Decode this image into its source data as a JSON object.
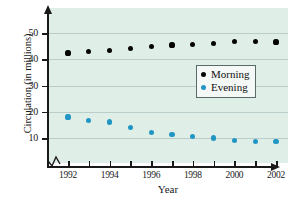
{
  "chart_data": {
    "type": "scatter",
    "title": "",
    "xlabel": "Year",
    "ylabel": "Circulation (in millions)",
    "x": [
      1992,
      1993,
      1994,
      1995,
      1996,
      1997,
      1998,
      1999,
      2000,
      2001,
      2002
    ],
    "xlim": [
      1991.5,
      2002.6
    ],
    "ylim": [
      0,
      55
    ],
    "grid": true,
    "axis_break": true,
    "legend_position": "center-right",
    "xtick_labels": [
      "1992",
      "1994",
      "1996",
      "1998",
      "2000",
      "2002"
    ],
    "xtick_values": [
      1992,
      1994,
      1996,
      1998,
      2000,
      2002
    ],
    "ytick_labels": [
      "10",
      "20",
      "30",
      "40",
      "50"
    ],
    "ytick_values": [
      10,
      20,
      30,
      40,
      50
    ],
    "series": [
      {
        "name": "Morning",
        "color": "#050505",
        "values": [
          42.4,
          43.0,
          43.4,
          44.2,
          44.8,
          45.4,
          45.6,
          46.0,
          46.8,
          46.8,
          46.6
        ]
      },
      {
        "name": "Evening",
        "color": "#2196c4",
        "values": [
          18.0,
          16.8,
          16.1,
          13.9,
          12.2,
          11.3,
          10.6,
          10.0,
          9.0,
          8.8,
          8.6
        ]
      }
    ]
  },
  "legend": {
    "items": [
      {
        "label": "Morning",
        "color": "#050505"
      },
      {
        "label": "Evening",
        "color": "#2196c4"
      }
    ]
  }
}
